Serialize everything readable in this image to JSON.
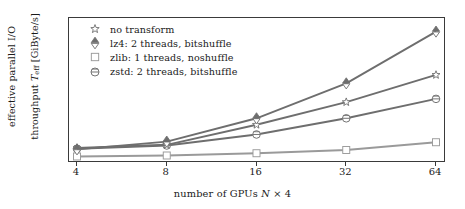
{
  "chart_data": {
    "type": "line",
    "title": "",
    "xlabel": "number of GPUs N × 4",
    "ylabel": "effective parallel I/O\nthroughput T_eff [GiByte/s]",
    "categories": [
      "4",
      "8",
      "16",
      "32",
      "64"
    ],
    "x": [
      4,
      8,
      16,
      32,
      64
    ],
    "xscale": "log2-categorical",
    "xtick_labels": [
      "4",
      "8",
      "16",
      "32",
      "64"
    ],
    "ytick_labels": [
      "0",
      "5",
      "10",
      "15",
      "20"
    ],
    "yticks": [
      0,
      5,
      10,
      15,
      20
    ],
    "ylim": [
      -0.6,
      21.5
    ],
    "grid": false,
    "legend_position": "top-left inside",
    "series": [
      {
        "name": "no transform",
        "marker": "star",
        "color": "#6e6e6e",
        "values": [
          1.4,
          1.9,
          5.0,
          8.5,
          12.7
        ]
      },
      {
        "name": "lz4: 2 threads, bitshuffle",
        "marker": "triangle-up-down",
        "color": "#6e6e6e",
        "values": [
          1.2,
          2.4,
          6.0,
          11.4,
          19.4
        ]
      },
      {
        "name": "zlib: 1 threads, noshuffle",
        "marker": "square",
        "color": "#9a9a9a",
        "values": [
          0.1,
          0.25,
          0.6,
          1.1,
          2.3
        ]
      },
      {
        "name": "zstd: 2 threads, bitshuffle",
        "marker": "circle-bar",
        "color": "#6e6e6e",
        "values": [
          1.3,
          1.8,
          3.5,
          6.0,
          9.0
        ]
      }
    ]
  },
  "axes": {
    "y_title_line1": "effective parallel I/O",
    "y_title_line2_pre": "throughput ",
    "y_title_var": "T",
    "y_title_sub": "eff",
    "y_title_line2_post": " [GiByte/s]",
    "x_title_pre": "number of GPUs ",
    "x_title_var": "N",
    "x_title_post": " × 4"
  },
  "legend": {
    "items": [
      {
        "label": "no transform",
        "marker": "star-marker"
      },
      {
        "label": "lz4: 2 threads, bitshuffle",
        "marker": "triangle-up-down-marker"
      },
      {
        "label": "zlib: 1 threads, noshuffle",
        "marker": "square-marker"
      },
      {
        "label": "zstd: 2 threads, bitshuffle",
        "marker": "circle-bar-marker"
      }
    ]
  }
}
